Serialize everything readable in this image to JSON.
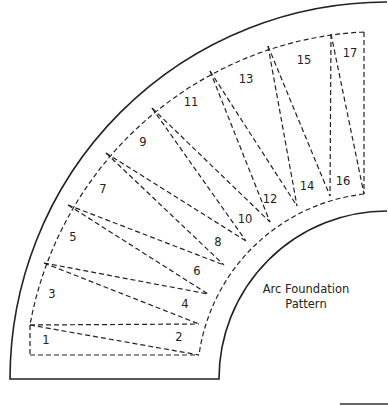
{
  "title": {
    "line1": "Arc Foundation",
    "line2": "Pattern"
  },
  "geometry": {
    "center": [
      387,
      379
    ],
    "outer_solid_radius": 377,
    "inner_solid_radius": 168,
    "outer_dashed_radius": 357,
    "inner_dashed_radius": 188,
    "bottom_line_y": 379
  },
  "piece_labels": [
    {
      "n": "1",
      "x": 46,
      "y": 344
    },
    {
      "n": "2",
      "x": 179,
      "y": 341
    },
    {
      "n": "3",
      "x": 52,
      "y": 298
    },
    {
      "n": "4",
      "x": 185,
      "y": 308
    },
    {
      "n": "5",
      "x": 73,
      "y": 241
    },
    {
      "n": "6",
      "x": 197,
      "y": 275
    },
    {
      "n": "7",
      "x": 103,
      "y": 193
    },
    {
      "n": "8",
      "x": 218,
      "y": 246
    },
    {
      "n": "9",
      "x": 143,
      "y": 146
    },
    {
      "n": "10",
      "x": 245,
      "y": 223
    },
    {
      "n": "11",
      "x": 191,
      "y": 106
    },
    {
      "n": "12",
      "x": 270,
      "y": 203
    },
    {
      "n": "13",
      "x": 246,
      "y": 83
    },
    {
      "n": "14",
      "x": 307,
      "y": 190
    },
    {
      "n": "15",
      "x": 304,
      "y": 64
    },
    {
      "n": "16",
      "x": 343,
      "y": 185
    },
    {
      "n": "17",
      "x": 350,
      "y": 57
    }
  ],
  "dashed_lines": [
    [
      [
        30,
        325
      ],
      [
        199,
        324
      ]
    ],
    [
      [
        30,
        325
      ],
      [
        199,
        355
      ]
    ],
    [
      [
        44,
        263
      ],
      [
        199,
        324
      ]
    ],
    [
      [
        44,
        263
      ],
      [
        208,
        294
      ]
    ],
    [
      [
        68,
        205
      ],
      [
        208,
        294
      ]
    ],
    [
      [
        68,
        205
      ],
      [
        224,
        265
      ]
    ],
    [
      [
        106,
        153
      ],
      [
        224,
        265
      ]
    ],
    [
      [
        106,
        153
      ],
      [
        246,
        241
      ]
    ],
    [
      [
        152,
        108
      ],
      [
        246,
        241
      ]
    ],
    [
      [
        152,
        108
      ],
      [
        270,
        222
      ]
    ],
    [
      [
        210,
        71
      ],
      [
        270,
        222
      ]
    ],
    [
      [
        210,
        71
      ],
      [
        297,
        206
      ]
    ],
    [
      [
        268,
        46
      ],
      [
        297,
        206
      ]
    ],
    [
      [
        268,
        46
      ],
      [
        330,
        196
      ]
    ],
    [
      [
        331,
        34
      ],
      [
        330,
        196
      ]
    ],
    [
      [
        331,
        34
      ],
      [
        364,
        194
      ]
    ],
    [
      [
        364,
        32
      ],
      [
        364,
        194
      ]
    ],
    [
      [
        30,
        325
      ],
      [
        30,
        355
      ]
    ],
    [
      [
        30,
        355
      ],
      [
        199,
        355
      ]
    ]
  ]
}
